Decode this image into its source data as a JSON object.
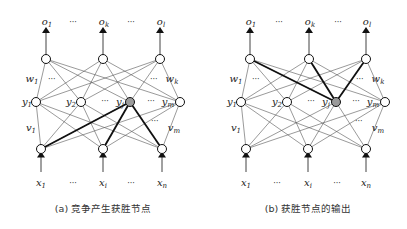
{
  "panels": [
    {
      "id": "a",
      "caption": "(a) 竞争产生获胜节点",
      "output_labels": [
        "o1",
        "…",
        "ok",
        "…",
        "ol"
      ],
      "hidden_labels": [
        "y1",
        "y2",
        "…",
        "yj",
        "…",
        "ym"
      ],
      "input_labels": [
        "x1",
        "…",
        "xi",
        "…",
        "xn"
      ],
      "weight_labels": {
        "w_left": "w1",
        "w_right": "wk",
        "v_left": "v1",
        "v_right": "vm"
      },
      "winner_node": "yj",
      "highlighted_connections": "input-to-winner"
    },
    {
      "id": "b",
      "caption": "(b) 获胜节点的输出",
      "output_labels": [
        "o1",
        "…",
        "ok",
        "…",
        "ol"
      ],
      "hidden_labels": [
        "y1",
        "y2",
        "…",
        "yj",
        "…",
        "ym"
      ],
      "input_labels": [
        "x1",
        "…",
        "xi",
        "…",
        "xn"
      ],
      "weight_labels": {
        "w_left": "w1",
        "w_right": "wk",
        "v_left": "v1",
        "v_right": "vm"
      },
      "winner_node": "yj",
      "highlighted_connections": "winner-to-output"
    }
  ],
  "colors": {
    "line": "#555555",
    "bold": "#111111",
    "winner_fill": "#9a9a9a",
    "node_fill": "#ffffff"
  }
}
